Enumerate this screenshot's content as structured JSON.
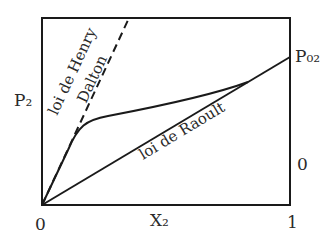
{
  "diagram": {
    "type": "vapor-pressure-vs-mole-fraction",
    "axes": {
      "y_label": "P₂",
      "x_label": "X₂",
      "x_min_tick": "0",
      "x_max_tick": "1",
      "right_axis_tick": "0",
      "right_axis_top_label": "P₀₂"
    },
    "curves": {
      "henry": {
        "label_line1": "loi de Henry",
        "label_line2": "Dalton",
        "style": "dashed"
      },
      "raoult": {
        "label": "loi de Raoult",
        "style": "solid"
      },
      "real": {
        "style": "solid"
      }
    },
    "colors": {
      "line": "#1a1a1a",
      "text": "#2a2a2a",
      "background": "#ffffff"
    }
  }
}
